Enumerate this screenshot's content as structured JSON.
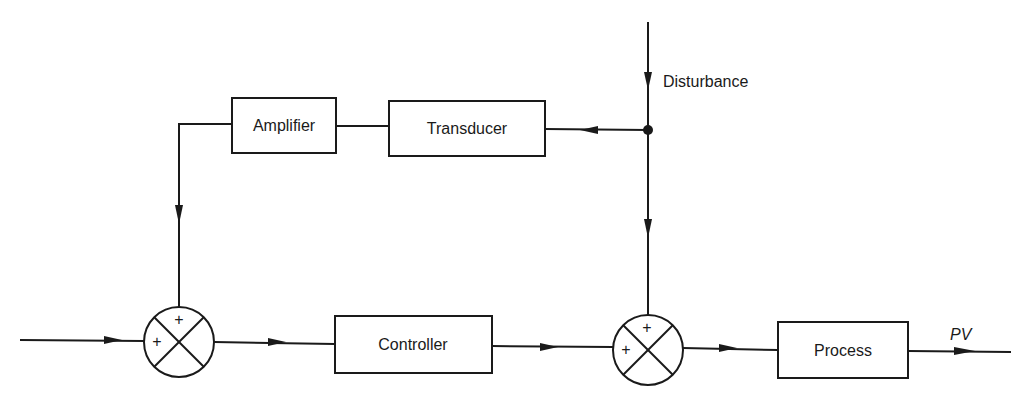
{
  "diagram": {
    "type": "feedforward-control-block-diagram",
    "blocks": {
      "amplifier": "Amplifier",
      "transducer": "Transducer",
      "controller": "Controller",
      "process": "Process"
    },
    "signals": {
      "disturbance": "Disturbance",
      "output": "PV"
    },
    "summing_junctions": [
      {
        "id": "sum1",
        "signs": {
          "top": "+",
          "left": "+"
        }
      },
      {
        "id": "sum2",
        "signs": {
          "top": "+",
          "left": "+"
        }
      }
    ],
    "connections": [
      "input -> sum1",
      "sum1 -> Controller",
      "Controller -> sum2",
      "sum2 -> Process",
      "Process -> PV",
      "Disturbance -> branch point",
      "branch point -> Transducer",
      "Transducer -> Amplifier",
      "Amplifier -> sum1",
      "branch point -> sum2"
    ],
    "colors": {
      "stroke": "#1a1a1a",
      "background": "#ffffff"
    }
  }
}
